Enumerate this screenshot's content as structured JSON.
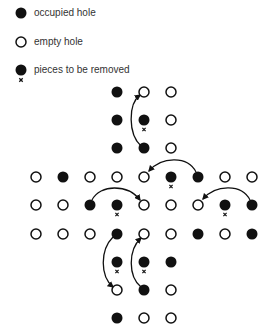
{
  "legend": {
    "items": [
      {
        "type": "occupied",
        "label": "occupied hole"
      },
      {
        "type": "empty",
        "label": "empty hole"
      },
      {
        "type": "removed",
        "label": "pieces to be removed"
      }
    ]
  },
  "colors": {
    "peg": "#111111",
    "text": "#333333",
    "background": "#ffffff"
  },
  "board": {
    "columns_x": [
      36,
      63,
      90,
      117,
      144,
      171,
      198,
      225,
      252
    ],
    "rows_y": [
      92,
      120,
      148,
      177,
      205,
      234,
      262,
      290,
      318
    ],
    "grid": [
      [
        "",
        "",
        "",
        "O",
        "E",
        "E",
        "",
        "",
        ""
      ],
      [
        "",
        "",
        "",
        "O",
        "X",
        "E",
        "",
        "",
        ""
      ],
      [
        "",
        "",
        "",
        "O",
        "O",
        "E",
        "",
        "",
        ""
      ],
      [
        "E",
        "O",
        "E",
        "E",
        "E",
        "X",
        "O",
        "E",
        "E"
      ],
      [
        "E",
        "E",
        "O",
        "X",
        "E",
        "E",
        "E",
        "X",
        "O"
      ],
      [
        "E",
        "E",
        "E",
        "O",
        "E",
        "E",
        "O",
        "E",
        "O"
      ],
      [
        "",
        "",
        "",
        "X",
        "X",
        "O",
        "",
        "",
        ""
      ],
      [
        "",
        "",
        "",
        "E",
        "O",
        "E",
        "",
        "",
        ""
      ],
      [
        "",
        "",
        "",
        "O",
        "E",
        "E",
        "",
        "",
        ""
      ]
    ],
    "grid_legend": {
      "O": "occupied hole",
      "E": "empty hole",
      "X": "piece to be removed"
    },
    "moves": [
      {
        "from": [
          2,
          4
        ],
        "to": [
          0,
          4
        ],
        "path": "M141 146 C128 134, 128 104, 140 95"
      },
      {
        "from": [
          3,
          6
        ],
        "to": [
          3,
          4
        ],
        "path": "M196 172 C188 156, 162 156, 149 171"
      },
      {
        "from": [
          4,
          2
        ],
        "to": [
          4,
          4
        ],
        "path": "M92 200 C100 184, 128 184, 140 200"
      },
      {
        "from": [
          4,
          8
        ],
        "to": [
          4,
          6
        ],
        "path": "M250 200 C242 184, 216 184, 203 199"
      },
      {
        "from": [
          5,
          3
        ],
        "to": [
          7,
          3
        ],
        "path": "M113 237 C100 250, 100 276, 113 287"
      },
      {
        "from": [
          7,
          4
        ],
        "to": [
          5,
          4
        ],
        "path": "M141 287 C128 276, 128 250, 141 238"
      }
    ]
  }
}
